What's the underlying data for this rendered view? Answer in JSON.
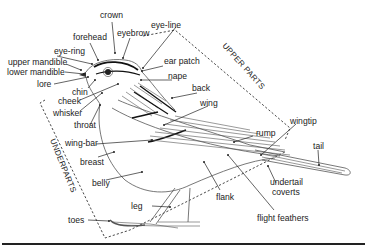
{
  "diagram": {
    "regions": {
      "upper": "UPPER PARTS",
      "under": "UNDERPARTS"
    },
    "labels": {
      "crown": "crown",
      "forehead": "forehead",
      "eyebrow": "eyebrow",
      "eye_line": "eye-line",
      "eye_ring": "eye-ring",
      "upper_mandible": "upper mandible",
      "lower_mandible": "lower mandible",
      "lore": "lore",
      "ear_patch": "ear patch",
      "nape": "nape",
      "chin": "chin",
      "cheek": "cheek",
      "whisker": "whisker",
      "throat": "throat",
      "back": "back",
      "wing": "wing",
      "wing_bar": "wing-bar",
      "breast": "breast",
      "belly": "belly",
      "rump": "rump",
      "wingtip": "wingtip",
      "tail": "tail",
      "undertail_coverts_1": "undertail",
      "undertail_coverts_2": "coverts",
      "flank": "flank",
      "flight_feathers": "flight feathers",
      "leg": "leg",
      "toes": "toes"
    }
  }
}
